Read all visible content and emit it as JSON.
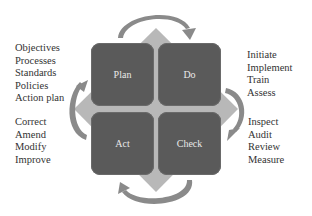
{
  "diagram": {
    "type": "PDCA cycle",
    "colors": {
      "box_fill": "#5a5a5a",
      "diamond_fill": "#b4b4b4",
      "arrow_fill": "#8a8a8a",
      "text_box": "#e8e8e8",
      "text_list": "#333333"
    },
    "quadrants": [
      {
        "id": "plan",
        "label": "Plan"
      },
      {
        "id": "do",
        "label": "Do"
      },
      {
        "id": "act",
        "label": "Act"
      },
      {
        "id": "check",
        "label": "Check"
      }
    ],
    "lists": {
      "plan": [
        "Objectives",
        "Processes",
        "Standards",
        "Policies",
        "Action plan"
      ],
      "do": [
        "Initiate",
        "Implement",
        "Train",
        "Assess"
      ],
      "check": [
        "Inspect",
        "Audit",
        "Review",
        "Measure"
      ],
      "act": [
        "Correct",
        "Amend",
        "Modify",
        "Improve"
      ]
    },
    "arrows": [
      {
        "from": "plan",
        "to": "do",
        "position": "top",
        "icon": "curved-arrow-icon"
      },
      {
        "from": "do",
        "to": "check",
        "position": "right",
        "icon": "curved-arrow-icon"
      },
      {
        "from": "check",
        "to": "act",
        "position": "bottom",
        "icon": "curved-arrow-icon"
      },
      {
        "from": "act",
        "to": "plan",
        "position": "left",
        "icon": "curved-arrow-icon"
      }
    ]
  }
}
